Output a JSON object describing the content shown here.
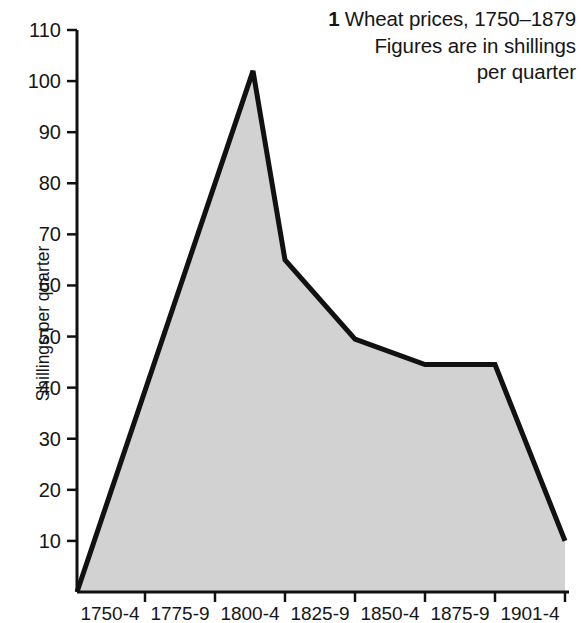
{
  "title": {
    "figure_number": "1",
    "line1": "Wheat prices, 1750–1879",
    "line2": "Figures are in shillings",
    "line3": "per quarter"
  },
  "axes": {
    "y_title": "Shillings per quarter",
    "y_ticks": [
      "110",
      "100",
      "90",
      "80",
      "70",
      "60",
      "50",
      "40",
      "30",
      "20",
      "10"
    ],
    "x_ticks": [
      "1750-4",
      "1775-9",
      "1800-4",
      "1825-9",
      "1850-4",
      "1875-9",
      "1901-4"
    ]
  },
  "colors": {
    "line": "#111111",
    "fill": "#d2d2d2",
    "axis": "#111111",
    "text": "#161616",
    "background": "#ffffff"
  },
  "chart_data": {
    "type": "area",
    "title": "Wheat prices, 1750–1879",
    "subtitle": "Figures are in shillings per quarter",
    "xlabel": "",
    "ylabel": "Shillings per quarter",
    "categories": [
      "1750-4",
      "1775-9",
      "1800-4",
      "1825-9",
      "1850-4",
      "1875-9",
      "1901-4"
    ],
    "x": [
      1747,
      1775,
      1800,
      1825,
      1850,
      1875,
      1901
    ],
    "values": [
      0,
      102,
      65,
      49.5,
      44.5,
      44.5,
      10
    ],
    "vertices": [
      {
        "label": "start",
        "value": 0
      },
      {
        "label": "1775-9",
        "value": 102
      },
      {
        "label": "1800-4",
        "value": 65
      },
      {
        "label": "1825-9",
        "value": 49.5
      },
      {
        "label": "1850-4",
        "value": 44.5
      },
      {
        "label": "1875-9",
        "value": 44.5
      },
      {
        "label": "1901-4",
        "value": 10
      }
    ],
    "ylim": [
      0,
      110
    ],
    "ytick_step": 10,
    "grid": false,
    "legend": false,
    "fill_color": "#d2d2d2",
    "line_color": "#111111"
  }
}
